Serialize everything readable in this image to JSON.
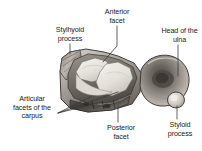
{
  "figure": {
    "background_color": "#ffffff",
    "text_color": "#1b1b1b"
  },
  "labels": {
    "stylhyoid_process": "Stylhyoid\nprocess",
    "anterior_facet": "Anterior\nfacet",
    "head_of_the_ulna": "Head of the\nulna",
    "articular_facets_of_the_carpus": "Articular\nfacets of the\ncarpus",
    "posterior_facet": "Posterior\nfacet",
    "styloid_process": "Styloid\nprocess"
  },
  "illustration": {
    "type": "grayscale-photograph",
    "parts": [
      {
        "name": "radius-body",
        "description": "Large irregular bone block at left with concave articular surface"
      },
      {
        "name": "anterior-facet-surface",
        "description": "Upper concave facet of distal radius"
      },
      {
        "name": "posterior-facet-surface",
        "description": "Lower-right facet of distal radius"
      },
      {
        "name": "ulna-head",
        "description": "Rounded oval mass at right with dark central depression"
      },
      {
        "name": "ulna-styloid-knob",
        "description": "Small rounded projection at lower right of ulna head"
      },
      {
        "name": "radial-styloid-ridge",
        "description": "Ridged projection at upper left of radius"
      }
    ],
    "tones": {
      "bone_light": "#efece8",
      "bone_mid": "#b9b4ad",
      "bone_shadow": "#6e6a66",
      "bone_dark": "#3d3a37",
      "outline": "#2a2a2a",
      "leader_line": "#3a3a3a"
    }
  }
}
